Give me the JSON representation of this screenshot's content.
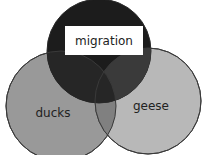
{
  "diagram": {
    "type": "venn",
    "sets": [
      {
        "id": "migration",
        "label": "migration",
        "fill": "#1e1e1e",
        "label_box": "#ffffff"
      },
      {
        "id": "ducks",
        "label": "ducks",
        "fill": "#9a9a9a"
      },
      {
        "id": "geese",
        "label": "geese",
        "fill": "#b5b5b5"
      }
    ],
    "stroke": "#3a3a3a"
  }
}
